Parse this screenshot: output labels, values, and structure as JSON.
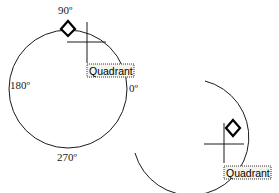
{
  "figure_1": {
    "angle_labels": {
      "top": "90º",
      "left": "180º",
      "right": "0º",
      "bottom": "270º"
    },
    "snap_marker": "diamond-quadrant-marker",
    "tooltip": "Quadrant"
  },
  "figure_2": {
    "snap_marker": "diamond-quadrant-marker",
    "tooltip": "Quadrant"
  },
  "colors": {
    "stroke": "#1a1a1a",
    "tooltip_bg": "#f4f4ec",
    "background": "#ffffff"
  }
}
